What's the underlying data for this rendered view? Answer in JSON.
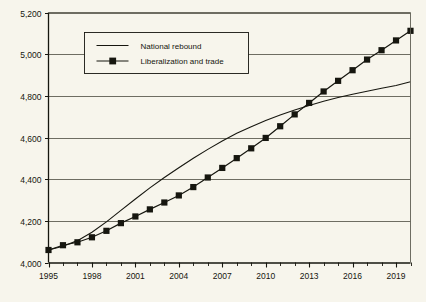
{
  "chart_data": {
    "type": "line",
    "title": "",
    "subtitle": "",
    "xlabel": "",
    "ylabel": "",
    "x": [
      1995,
      1996,
      1997,
      1998,
      1999,
      2000,
      2001,
      2002,
      2003,
      2004,
      2005,
      2006,
      2007,
      2008,
      2009,
      2010,
      2011,
      2012,
      2013,
      2014,
      2015,
      2016,
      2017,
      2018,
      2019,
      2020
    ],
    "xlim": [
      1995,
      2020
    ],
    "ylim": [
      4000,
      5200
    ],
    "yticks": [
      4000,
      4200,
      4400,
      4600,
      4800,
      5000,
      5200
    ],
    "ytick_labels": [
      "4,000",
      "4,200",
      "4,400",
      "4,600",
      "4,800",
      "5,000",
      "5,200"
    ],
    "xticks": [
      1995,
      1998,
      2001,
      2004,
      2007,
      2010,
      2013,
      2016,
      2019
    ],
    "xtick_labels": [
      "1995",
      "1998",
      "2001",
      "2004",
      "2007",
      "2010",
      "2013",
      "2016",
      "2019"
    ],
    "x_minor_ticks": [
      1996,
      1997,
      1999,
      2000,
      2002,
      2003,
      2005,
      2006,
      2008,
      2009,
      2011,
      2012,
      2014,
      2015,
      2017,
      2018,
      2020
    ],
    "grid": "horizontal",
    "legend_position": "top-left-inside",
    "series": [
      {
        "name": "National rebound",
        "marker": "none",
        "color": "#16160f",
        "values": [
          4060,
          4078,
          4105,
          4145,
          4195,
          4250,
          4305,
          4358,
          4408,
          4455,
          4500,
          4543,
          4583,
          4620,
          4652,
          4682,
          4708,
          4732,
          4754,
          4774,
          4792,
          4808,
          4822,
          4836,
          4850,
          4868
        ]
      },
      {
        "name": "Liberalization and trade",
        "marker": "square",
        "color": "#16160f",
        "values": [
          4060,
          4083,
          4097,
          4121,
          4152,
          4189,
          4221,
          4255,
          4288,
          4322,
          4362,
          4408,
          4454,
          4501,
          4548,
          4598,
          4654,
          4711,
          4766,
          4821,
          4872,
          4923,
          4974,
          5019,
          5066,
          5112
        ]
      }
    ]
  },
  "legend": {
    "entries": [
      {
        "label": "National rebound",
        "marker": "line"
      },
      {
        "label": "Liberalization and trade",
        "marker": "line-square"
      }
    ]
  },
  "caption": {
    "text": ""
  }
}
